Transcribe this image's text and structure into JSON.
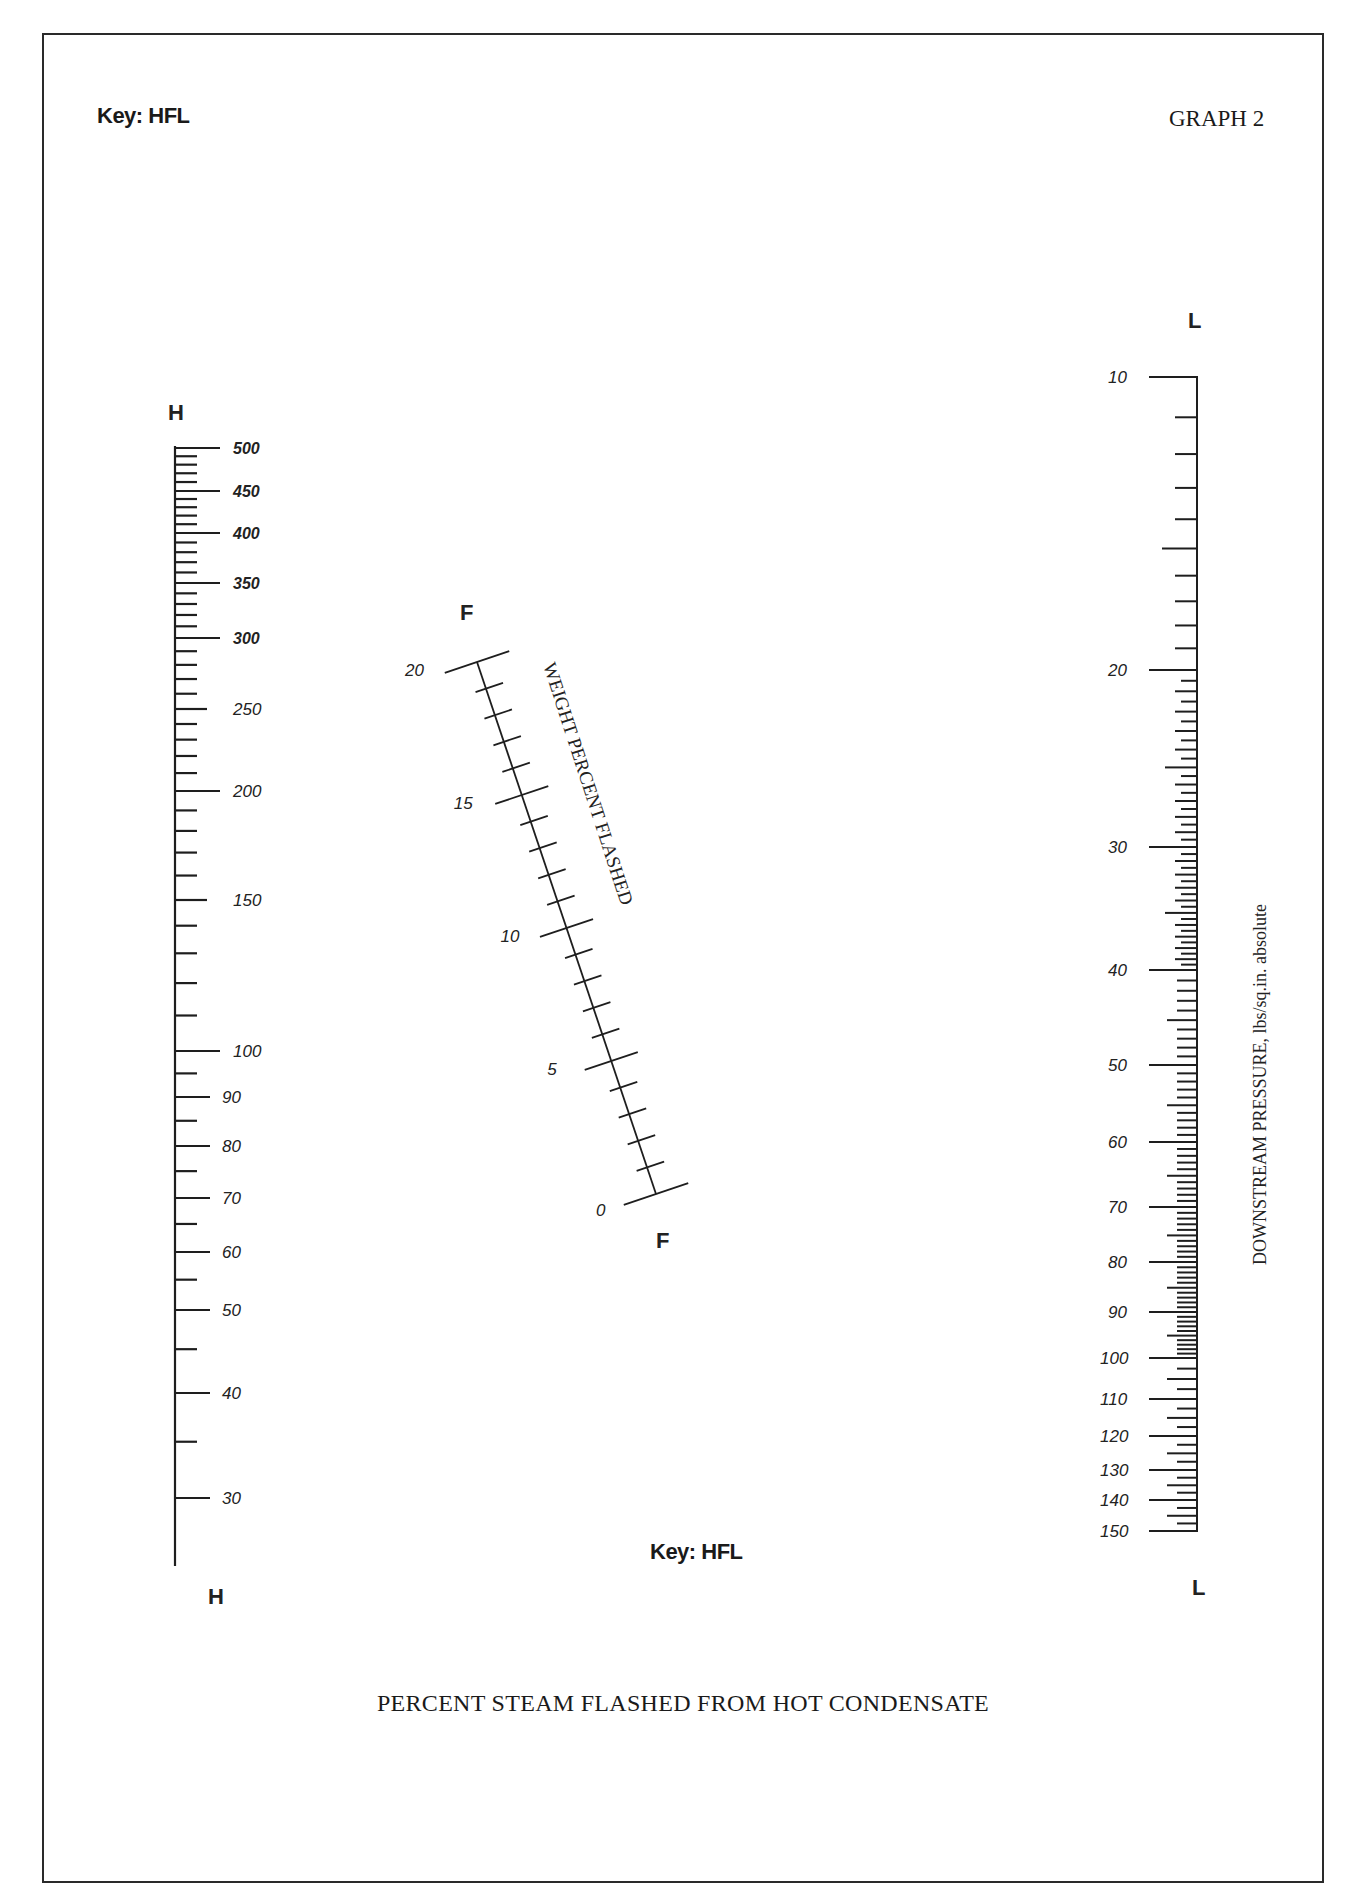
{
  "page": {
    "key_top": "Key: HFL",
    "key_bottom": "Key: HFL",
    "graph_number": "GRAPH 2",
    "caption": "PERCENT STEAM FLASHED FROM HOT CONDENSATE"
  },
  "scales": {
    "H": {
      "letter_top": "H",
      "letter_bottom": "H",
      "labels": [
        "500",
        "450",
        "400",
        "350",
        "300",
        "250",
        "200",
        "150",
        "100",
        "90",
        "80",
        "70",
        "60",
        "50",
        "40",
        "30"
      ]
    },
    "F": {
      "letter_top": "F",
      "letter_bottom": "F",
      "title": "WEIGHT PERCENT FLASHED",
      "labels": [
        "20",
        "15",
        "10",
        "5",
        "0"
      ]
    },
    "L": {
      "letter_top": "L",
      "letter_bottom": "L",
      "title": "DOWNSTREAM PRESSURE, lbs/sq.in. absolute",
      "labels": [
        "10",
        "20",
        "30",
        "40",
        "50",
        "60",
        "70",
        "80",
        "90",
        "100",
        "110",
        "120",
        "130",
        "140",
        "150"
      ]
    }
  },
  "chart_data": {
    "type": "nomograph",
    "title": "PERCENT STEAM FLASHED FROM HOT CONDENSATE",
    "subtitle": "GRAPH 2",
    "key": "HFL",
    "axes": [
      {
        "id": "H",
        "position": "left",
        "orientation": "vertical",
        "scale": "log",
        "range": [
          30,
          500
        ],
        "major_ticks": [
          500,
          450,
          400,
          350,
          300,
          250,
          200,
          150,
          100,
          90,
          80,
          70,
          60,
          50,
          40,
          30
        ]
      },
      {
        "id": "F",
        "position": "center",
        "orientation": "diagonal",
        "label": "WEIGHT PERCENT FLASHED",
        "scale": "linear",
        "range": [
          0,
          20
        ],
        "major_ticks": [
          0,
          5,
          10,
          15,
          20
        ],
        "minor_step": 1
      },
      {
        "id": "L",
        "position": "right",
        "orientation": "vertical",
        "label": "DOWNSTREAM PRESSURE, lbs/sq.in. absolute",
        "scale": "log",
        "range": [
          10,
          150
        ],
        "major_ticks": [
          10,
          20,
          30,
          40,
          50,
          60,
          70,
          80,
          90,
          100,
          110,
          120,
          130,
          140,
          150
        ]
      }
    ],
    "grid": false,
    "legend": "none"
  }
}
